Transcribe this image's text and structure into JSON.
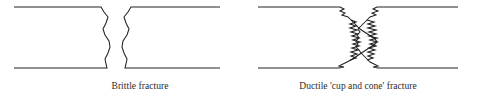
{
  "figure": {
    "title": "",
    "background_color": "#ffffff",
    "line_color": "#222222",
    "text_color": "#2b2b2b",
    "width": 477,
    "height": 104,
    "panels": [
      {
        "id": "brittle",
        "caption": "Brittle fracture",
        "description": "Two bar halves separated by a near-vertical slightly wavy fracture surface",
        "bar_top_y": 7,
        "bar_bottom_y": 68,
        "bar_left_x": 14,
        "bar_right_x": 220,
        "gap_center_x": 119,
        "fracture_style": "smooth-wavy"
      },
      {
        "id": "ductile",
        "caption": "Ductile 'cup and cone' fracture",
        "description": "Two bar halves with cup-and-cone fracture surfaces: tapered shear lips and a jagged fibrous central zone",
        "bar_top_y": 7,
        "bar_bottom_y": 68,
        "bar_left_x": 258,
        "bar_right_x": 458,
        "gap_center_x": 368,
        "fracture_style": "zigzag-cup-and-cone"
      }
    ]
  },
  "captions": {
    "brittle": "Brittle fracture",
    "ductile": "Ductile 'cup and cone' fracture"
  }
}
